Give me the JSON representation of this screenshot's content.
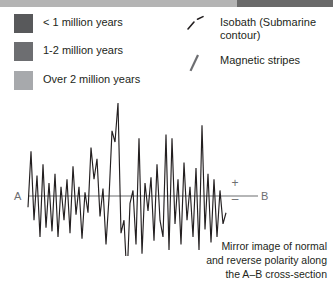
{
  "top_strip": {
    "light_color": "#b4b4b4",
    "dark_color": "#6a6a6a"
  },
  "legend": {
    "age_items": [
      {
        "label": "< 1 million years",
        "color": "#58595b",
        "swatch_icon": "age-swatch-icon"
      },
      {
        "label": "1-2 million years",
        "color": "#6d6e71",
        "swatch_icon": "age-swatch-icon"
      },
      {
        "label": "Over 2 million years",
        "color": "#a7a9ac",
        "swatch_icon": "age-swatch-icon"
      }
    ],
    "symbol_items": [
      {
        "label": "Isobath (Submarine contour)",
        "icon": "dashed-line-icon",
        "color": "#231f20"
      },
      {
        "label": "Magnetic stripes",
        "icon": "stripe-icon",
        "color": "#6d6e71"
      }
    ]
  },
  "chart_labels": {
    "left_endpoint": "A",
    "right_endpoint": "B",
    "polarity_positive": "+",
    "polarity_negative": "–",
    "axis_color": "#6d6e71"
  },
  "caption": {
    "line1": "Mirror image of normal",
    "line2": "and reverse polarity along",
    "line3": "the A–B cross-section"
  },
  "chart_data": {
    "type": "line",
    "title": "",
    "subtitle": "",
    "xlabel": "",
    "ylabel": "Magnetic polarity anomaly",
    "grid": false,
    "legend_position": "none",
    "line_color": "#231f20",
    "baseline_value": 0,
    "xlim": [
      0,
      252
    ],
    "ylim": [
      -100,
      100
    ],
    "axis_y_pixel": 196,
    "series": [
      {
        "name": "Magnetic anomaly profile",
        "x": [
          28,
          31,
          34,
          37,
          40,
          43,
          46,
          49,
          52,
          55,
          58,
          61,
          64,
          67,
          70,
          73,
          76,
          79,
          82,
          85,
          88,
          91,
          94,
          97,
          100,
          103,
          106,
          109,
          112,
          115,
          118,
          121,
          124,
          127,
          130,
          133,
          136,
          139,
          142,
          145,
          148,
          151,
          154,
          157,
          160,
          163,
          166,
          169,
          172,
          175,
          178,
          181,
          184,
          187,
          190,
          193,
          196,
          199,
          202,
          205,
          208,
          211,
          214,
          217,
          220,
          223,
          226
        ],
        "y": [
          -12,
          48,
          -26,
          22,
          -44,
          34,
          -34,
          14,
          -38,
          24,
          -44,
          10,
          -26,
          18,
          -40,
          32,
          -20,
          10,
          -46,
          4,
          -18,
          52,
          18,
          40,
          -22,
          8,
          -52,
          -2,
          70,
          58,
          100,
          -40,
          -26,
          -90,
          -8,
          6,
          -52,
          62,
          -62,
          14,
          -16,
          20,
          -48,
          34,
          -26,
          -44,
          66,
          -58,
          62,
          -30,
          18,
          -52,
          36,
          -26,
          10,
          -44,
          30,
          -58,
          76,
          -36,
          24,
          -50,
          18,
          -44,
          6,
          -30,
          -18
        ]
      }
    ],
    "annotations": [
      {
        "text": "A",
        "x": 14,
        "y": 0,
        "role": "left-endpoint"
      },
      {
        "text": "B",
        "x": 261,
        "y": 0,
        "role": "right-endpoint"
      },
      {
        "text": "+",
        "x": 233,
        "y": 18,
        "role": "polarity-positive"
      },
      {
        "text": "–",
        "x": 233,
        "y": -18,
        "role": "polarity-negative"
      }
    ]
  }
}
